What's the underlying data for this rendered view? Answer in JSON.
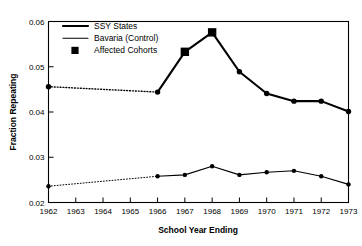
{
  "chart_data": {
    "type": "line",
    "title": "",
    "xlabel": "School Year Ending",
    "ylabel": "Fraction Repeating",
    "x": [
      1962,
      1963,
      1964,
      1965,
      1966,
      1967,
      1968,
      1969,
      1970,
      1971,
      1972,
      1973
    ],
    "xtick_labels": [
      "1962",
      "1963",
      "1964",
      "1965",
      "1966",
      "1967",
      "1968",
      "1969",
      "1970",
      "1971",
      "1972",
      "1973"
    ],
    "xlim": [
      1962,
      1973
    ],
    "ylim": [
      0.02,
      0.06
    ],
    "ytick_labels": [
      "0.02",
      "0.03",
      "0.04",
      "0.05",
      "0.06"
    ],
    "yticks": [
      0.02,
      0.03,
      0.04,
      0.05,
      0.06
    ],
    "grid": false,
    "legend_position": "top-left",
    "series": [
      {
        "name": "SSY States",
        "style": "thick-solid",
        "marker": "circle",
        "x": [
          1962,
          1966,
          1967,
          1968,
          1969,
          1970,
          1971,
          1972,
          1973
        ],
        "values": [
          0.0456,
          0.0444,
          0.0533,
          0.0576,
          0.0489,
          0.0441,
          0.0424,
          0.0424,
          0.0401
        ],
        "interpolated_segment": [
          1962,
          1966
        ],
        "affected_years": [
          1967,
          1968
        ]
      },
      {
        "name": "Bavaria (Control)",
        "style": "thin-solid",
        "marker": "circle",
        "x": [
          1962,
          1966,
          1967,
          1968,
          1969,
          1970,
          1971,
          1972,
          1973
        ],
        "values": [
          0.0236,
          0.0258,
          0.0261,
          0.028,
          0.0261,
          0.0267,
          0.027,
          0.0258,
          0.024
        ],
        "interpolated_segment": [
          1962,
          1966
        ],
        "affected_years": []
      }
    ],
    "legend": [
      {
        "label": "SSY States",
        "symbol": "thick-line"
      },
      {
        "label": "Bavaria (Control)",
        "symbol": "thin-line"
      },
      {
        "label": "Affected Cohorts",
        "symbol": "filled-square"
      }
    ]
  },
  "colors": {
    "ink": "#000000",
    "background": "#ffffff"
  }
}
